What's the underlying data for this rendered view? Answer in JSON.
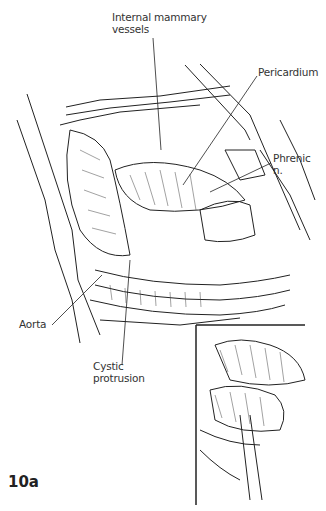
{
  "figure": {
    "id_label": "10a"
  },
  "labels": {
    "internal_mammary": {
      "line1": "Internal mammary",
      "line2": "vessels"
    },
    "pericardium": {
      "line1": "Pericardium"
    },
    "phrenic": {
      "line1": "Phrenic",
      "line2": "n."
    },
    "aorta": {
      "line1": "Aorta"
    },
    "cystic": {
      "line1": "Cystic",
      "line2": "protrusion"
    }
  },
  "colors": {
    "ink": "#222222",
    "label_text": "#333333",
    "background": "#ffffff"
  }
}
